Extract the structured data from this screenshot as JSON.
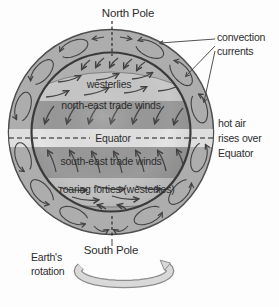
{
  "labels": {
    "north_pole": "North Pole",
    "south_pole": "South Pole",
    "convection": [
      "convection",
      "currents"
    ],
    "hot_air": [
      "hot air",
      "rises over",
      "Equator"
    ],
    "earth_rotation": [
      "Earth's",
      "rotation"
    ]
  },
  "bands": {
    "westerlies": "westerlies",
    "northeast_trades": "north-east trade winds",
    "equator": "Equator",
    "southeast_trades": "south-east trade winds",
    "roaring_forties": "roaring forties (westerlies)"
  },
  "colors": {
    "background": "#fdfdfd",
    "ring": "#adadad",
    "ring_outline": "#4e4e4e",
    "globe_outline": "#3a3a3a",
    "polar_cap": "#b3b3b3",
    "westerlies_band": "#c9c9c9",
    "trade_winds_band": "#9a9a9a",
    "equator_band": "#e4e4e4",
    "equator_band_ring": "#dedede",
    "roaring_forties_band": "#c4c4c4",
    "loop": "#424242",
    "arrow": "#454545",
    "pointer_line": "#3f3f3f",
    "dash_line": "#1c1c1c",
    "text": "#2d2d2d",
    "rotation_ribbon": "#d9d9d9",
    "rotation_ribbon_outline": "#8c8c8c"
  }
}
